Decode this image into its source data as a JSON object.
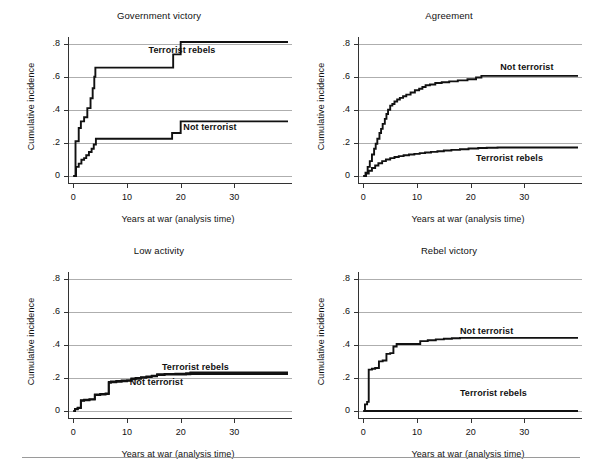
{
  "figure": {
    "background": "#ffffff",
    "line_color": "#111111",
    "grid_color": "#9a9a9a",
    "footer_rule": {
      "left": 22,
      "top": 457,
      "width": 558
    }
  },
  "common": {
    "xlabel": "Years at war (analysis time)",
    "ylabel": "Cumulative incidence",
    "ytick_labels": [
      "0",
      ".2",
      ".4",
      ".6",
      ".8"
    ],
    "ytick_values": [
      0,
      0.2,
      0.4,
      0.6,
      0.8
    ],
    "xtick_labels": [
      "0",
      "10",
      "20",
      "30"
    ],
    "xtick_values": [
      0,
      10,
      20,
      30
    ],
    "xlim": [
      -1,
      40
    ],
    "ylim": [
      0,
      0.84
    ],
    "grid": "horizontal"
  },
  "chart_data": [
    {
      "id": "government-victory",
      "type": "line",
      "title": "Government victory",
      "xlabel": "Years at war (analysis time)",
      "ylabel": "Cumulative incidence",
      "xlim": [
        -1,
        40
      ],
      "ylim": [
        0,
        0.84
      ],
      "xticks": [
        0,
        10,
        20,
        30
      ],
      "yticks": [
        0,
        0.2,
        0.4,
        0.6,
        0.8
      ],
      "series": [
        {
          "name": "Terrorist rebels",
          "label": "Terrorist rebels",
          "label_x": 14.0,
          "label_y": 0.755,
          "step": "post",
          "x": [
            0,
            0.4,
            0.7,
            1.0,
            1.4,
            2.0,
            2.6,
            3.2,
            3.6,
            3.9,
            4.1,
            18.0,
            18.6,
            20.0,
            40
          ],
          "y": [
            0.0,
            0.21,
            0.21,
            0.29,
            0.33,
            0.355,
            0.41,
            0.47,
            0.53,
            0.6,
            0.655,
            0.655,
            0.735,
            0.81,
            0.81
          ]
        },
        {
          "name": "Not terrorist",
          "label": "Not terrorist",
          "label_x": 20.5,
          "label_y": 0.293,
          "step": "post",
          "x": [
            0,
            0.5,
            1.0,
            1.5,
            2.0,
            2.4,
            2.9,
            3.4,
            3.8,
            4.2,
            17.8,
            18.4,
            20.0,
            40
          ],
          "y": [
            0.0,
            0.055,
            0.075,
            0.098,
            0.108,
            0.125,
            0.145,
            0.165,
            0.19,
            0.225,
            0.225,
            0.26,
            0.33,
            0.33
          ]
        }
      ]
    },
    {
      "id": "agreement",
      "type": "line",
      "title": "Agreement",
      "xlabel": "Years at war (analysis time)",
      "ylabel": "Cumulative incidence",
      "xlim": [
        -1,
        40
      ],
      "ylim": [
        0,
        0.84
      ],
      "xticks": [
        0,
        10,
        20,
        30
      ],
      "yticks": [
        0,
        0.2,
        0.4,
        0.6,
        0.8
      ],
      "series": [
        {
          "name": "Not terrorist",
          "label": "Not terrorist",
          "label_x": 25.5,
          "label_y": 0.655,
          "step": "post",
          "x": [
            0,
            0.4,
            0.8,
            1.2,
            1.6,
            2.0,
            2.3,
            2.6,
            3.0,
            3.3,
            3.6,
            4.0,
            4.3,
            4.6,
            5.0,
            5.4,
            5.8,
            6.3,
            6.8,
            7.4,
            8.0,
            8.8,
            9.6,
            10.4,
            11.0,
            11.6,
            12.4,
            13.4,
            14.6,
            16.0,
            17.6,
            19.4,
            21.0,
            22.0,
            40
          ],
          "y": [
            0.0,
            0.02,
            0.055,
            0.09,
            0.13,
            0.165,
            0.195,
            0.225,
            0.26,
            0.285,
            0.315,
            0.345,
            0.375,
            0.4,
            0.425,
            0.435,
            0.45,
            0.462,
            0.472,
            0.482,
            0.492,
            0.505,
            0.518,
            0.527,
            0.538,
            0.548,
            0.553,
            0.562,
            0.567,
            0.572,
            0.578,
            0.585,
            0.595,
            0.605,
            0.605
          ]
        },
        {
          "name": "Terrorist rebels",
          "label": "Terrorist rebels",
          "label_x": 21.0,
          "label_y": 0.105,
          "step": "post",
          "x": [
            0,
            0.5,
            1.0,
            1.6,
            2.2,
            2.8,
            3.5,
            4.2,
            5.0,
            5.8,
            6.6,
            7.5,
            8.5,
            9.5,
            10.5,
            11.5,
            12.6,
            13.8,
            15.0,
            16.4,
            18.0,
            19.6,
            21.4,
            23.0,
            25.0,
            40
          ],
          "y": [
            0.0,
            0.015,
            0.032,
            0.048,
            0.063,
            0.077,
            0.09,
            0.1,
            0.108,
            0.115,
            0.12,
            0.125,
            0.13,
            0.134,
            0.138,
            0.142,
            0.146,
            0.15,
            0.154,
            0.158,
            0.162,
            0.166,
            0.169,
            0.171,
            0.172,
            0.172
          ]
        }
      ]
    },
    {
      "id": "low-activity",
      "type": "line",
      "title": "Low activity",
      "xlabel": "Years at war (analysis time)",
      "ylabel": "Cumulative incidence",
      "xlim": [
        -1,
        40
      ],
      "ylim": [
        0,
        0.84
      ],
      "xticks": [
        0,
        10,
        20,
        30
      ],
      "yticks": [
        0,
        0.2,
        0.4,
        0.6,
        0.8
      ],
      "series": [
        {
          "name": "Terrorist rebels",
          "label": "Terrorist rebels",
          "label_x": 16.5,
          "label_y": 0.262,
          "step": "post",
          "x": [
            0,
            0.3,
            0.8,
            1.4,
            2.0,
            3.0,
            4.0,
            5.0,
            6.0,
            6.6,
            7.0,
            8.0,
            9.0,
            10.0,
            10.8,
            11.6,
            12.6,
            13.6,
            14.6,
            15.6,
            17.0,
            19.0,
            21.0,
            21.8,
            40
          ],
          "y": [
            0.0,
            0.012,
            0.02,
            0.065,
            0.068,
            0.072,
            0.1,
            0.103,
            0.106,
            0.175,
            0.178,
            0.181,
            0.184,
            0.186,
            0.196,
            0.199,
            0.205,
            0.209,
            0.213,
            0.222,
            0.224,
            0.226,
            0.228,
            0.233,
            0.233
          ]
        },
        {
          "name": "Not terrorist",
          "label": "Not terrorist",
          "label_x": 10.5,
          "label_y": 0.168,
          "step": "post",
          "x": [
            0,
            0.3,
            0.8,
            1.4,
            2.0,
            3.0,
            4.0,
            5.0,
            6.0,
            6.6,
            7.0,
            8.0,
            9.0,
            10.0,
            10.8,
            11.6,
            12.6,
            13.6,
            14.6,
            15.6,
            17.0,
            19.0,
            21.0,
            21.8,
            40
          ],
          "y": [
            0.0,
            0.01,
            0.018,
            0.062,
            0.065,
            0.069,
            0.097,
            0.1,
            0.103,
            0.171,
            0.174,
            0.177,
            0.18,
            0.182,
            0.192,
            0.195,
            0.201,
            0.205,
            0.209,
            0.218,
            0.22,
            0.221,
            0.222,
            0.224,
            0.224
          ]
        }
      ]
    },
    {
      "id": "rebel-victory",
      "type": "line",
      "title": "Rebel victory",
      "xlabel": "Years at war (analysis time)",
      "ylabel": "Cumulative incidence",
      "xlim": [
        -1,
        40
      ],
      "ylim": [
        0,
        0.84
      ],
      "xticks": [
        0,
        10,
        20,
        30
      ],
      "yticks": [
        0,
        0.2,
        0.4,
        0.6,
        0.8
      ],
      "series": [
        {
          "name": "Not terrorist",
          "label": "Not terrorist",
          "label_x": 18.0,
          "label_y": 0.478,
          "step": "post",
          "x": [
            0,
            0.3,
            0.7,
            1.0,
            1.6,
            2.2,
            2.9,
            3.6,
            4.3,
            5.0,
            5.6,
            6.2,
            10.0,
            10.6,
            12.0,
            13.5,
            15.0,
            16.5,
            18.0,
            40
          ],
          "y": [
            0.0,
            0.04,
            0.055,
            0.25,
            0.255,
            0.26,
            0.3,
            0.305,
            0.345,
            0.35,
            0.39,
            0.405,
            0.405,
            0.422,
            0.428,
            0.433,
            0.437,
            0.44,
            0.442,
            0.442
          ]
        },
        {
          "name": "Terrorist rebels",
          "label": "Terrorist rebels",
          "label_x": 18.0,
          "label_y": 0.105,
          "step": "post",
          "x": [
            0,
            40
          ],
          "y": [
            0.0,
            0.0
          ]
        }
      ]
    }
  ],
  "panels_layout": [
    {
      "left": 18,
      "top": 10,
      "width": 282,
      "height": 228
    },
    {
      "left": 308,
      "top": 10,
      "width": 282,
      "height": 228
    },
    {
      "left": 18,
      "top": 245,
      "width": 282,
      "height": 228
    },
    {
      "left": 308,
      "top": 245,
      "width": 282,
      "height": 228
    }
  ]
}
